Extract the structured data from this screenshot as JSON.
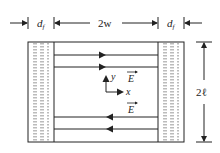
{
  "diagram": {
    "labels": {
      "left_width": "d",
      "left_width_sub": "f",
      "center_width": "2w",
      "right_width": "d",
      "right_width_sub": "f",
      "height": "2ℓ",
      "axis_x": "x",
      "axis_y": "y",
      "field_upper": "E",
      "field_lower": "E"
    },
    "field_lines": [
      {
        "position": "upper-1",
        "direction": "right"
      },
      {
        "position": "upper-2",
        "direction": "right"
      },
      {
        "position": "lower-1",
        "direction": "left"
      },
      {
        "position": "lower-2",
        "direction": "left"
      }
    ],
    "colors": {
      "stroke": "#222222",
      "dotted": "#555555",
      "background": "#ffffff"
    }
  }
}
